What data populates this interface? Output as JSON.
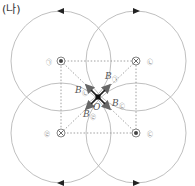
{
  "title": "(나)",
  "center": {
    "label": "O",
    "x": 98,
    "y": 97
  },
  "wires": [
    {
      "id": "wire-a",
      "symbol": "dot",
      "x": 61,
      "y": 61,
      "label": "㉠",
      "label_x": 49,
      "label_y": 61
    },
    {
      "id": "wire-b",
      "symbol": "cross",
      "x": 136,
      "y": 61,
      "label": "㉡",
      "label_x": 150,
      "label_y": 61
    },
    {
      "id": "wire-d",
      "symbol": "cross",
      "x": 61,
      "y": 133,
      "label": "㉣",
      "label_x": 47,
      "label_y": 133
    },
    {
      "id": "wire-c",
      "symbol": "dot",
      "x": 136,
      "y": 133,
      "label": "㉢",
      "label_x": 150,
      "label_y": 133
    }
  ],
  "field_circles": [
    {
      "cx": 61,
      "cy": 61,
      "r": 50,
      "arrow": "left",
      "arrow_x": 61,
      "arrow_y": 11
    },
    {
      "cx": 136,
      "cy": 61,
      "r": 50,
      "arrow": "right",
      "arrow_x": 136,
      "arrow_y": 11
    },
    {
      "cx": 61,
      "cy": 133,
      "r": 50,
      "arrow": "left",
      "arrow_x": 61,
      "arrow_y": 183
    },
    {
      "cx": 136,
      "cy": 133,
      "r": 50,
      "arrow": "right",
      "arrow_x": 136,
      "arrow_y": 183
    }
  ],
  "vectors": [
    {
      "name": "B",
      "sub": "㉠",
      "label": "B",
      "label_sub": "㉠",
      "lx": 88,
      "ly": 79
    },
    {
      "name": "B",
      "sub": "㉡",
      "label": "B",
      "label_sub": "㉡",
      "lx": 63,
      "ly": 92
    },
    {
      "name": "B",
      "sub": "㉢",
      "label": "B",
      "label_sub": "㉢",
      "lx": 111,
      "ly": 104
    },
    {
      "name": "B",
      "sub": "㉣",
      "label": "B",
      "label_sub": "㉣",
      "lx": 84,
      "ly": 117
    }
  ],
  "colors": {
    "circle": "#b8b8b8",
    "dotted": "#888888",
    "vector": "#666666",
    "center": "#111111"
  }
}
